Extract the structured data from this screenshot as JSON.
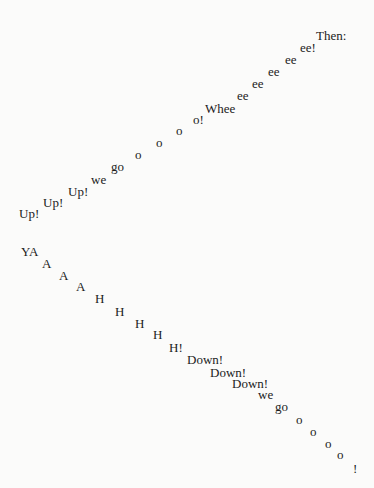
{
  "poem": {
    "words": [
      {
        "text": "Then:",
        "x": 316,
        "y": 39
      },
      {
        "text": "ee!",
        "x": 300,
        "y": 51
      },
      {
        "text": "ee",
        "x": 285,
        "y": 63
      },
      {
        "text": "ee",
        "x": 268,
        "y": 75
      },
      {
        "text": "ee",
        "x": 252,
        "y": 87
      },
      {
        "text": "ee",
        "x": 237,
        "y": 99
      },
      {
        "text": "Whee",
        "x": 205,
        "y": 112
      },
      {
        "text": "o!",
        "x": 193,
        "y": 123
      },
      {
        "text": "o",
        "x": 176,
        "y": 134
      },
      {
        "text": "o",
        "x": 156,
        "y": 146
      },
      {
        "text": "o",
        "x": 135,
        "y": 158
      },
      {
        "text": "go",
        "x": 111,
        "y": 170
      },
      {
        "text": "we",
        "x": 91,
        "y": 183
      },
      {
        "text": "Up!",
        "x": 68,
        "y": 195
      },
      {
        "text": "Up!",
        "x": 43,
        "y": 206
      },
      {
        "text": "Up!",
        "x": 19,
        "y": 217
      },
      {
        "text": "YA",
        "x": 21,
        "y": 255
      },
      {
        "text": "A",
        "x": 42,
        "y": 267
      },
      {
        "text": "A",
        "x": 59,
        "y": 279
      },
      {
        "text": "A",
        "x": 76,
        "y": 290
      },
      {
        "text": "H",
        "x": 95,
        "y": 302
      },
      {
        "text": "H",
        "x": 115,
        "y": 315
      },
      {
        "text": "H",
        "x": 135,
        "y": 327
      },
      {
        "text": "H",
        "x": 153,
        "y": 338
      },
      {
        "text": "H!",
        "x": 169,
        "y": 351
      },
      {
        "text": "Down!",
        "x": 187,
        "y": 363
      },
      {
        "text": "Down!",
        "x": 210,
        "y": 376
      },
      {
        "text": "Down!",
        "x": 232,
        "y": 387
      },
      {
        "text": "we",
        "x": 258,
        "y": 398
      },
      {
        "text": "go",
        "x": 275,
        "y": 410
      },
      {
        "text": "o",
        "x": 296,
        "y": 423
      },
      {
        "text": "o",
        "x": 310,
        "y": 435
      },
      {
        "text": "o",
        "x": 325,
        "y": 447
      },
      {
        "text": "o",
        "x": 337,
        "y": 458
      },
      {
        "text": "!",
        "x": 353,
        "y": 472
      }
    ]
  },
  "colors": {
    "background": "#fbfbfa",
    "text": "#1c1c1c"
  }
}
